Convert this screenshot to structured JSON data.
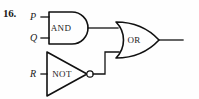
{
  "figure": {
    "problem_number": "16.",
    "type": "logic-circuit-diagram"
  },
  "inputs": [
    {
      "id": "p",
      "label": "P"
    },
    {
      "id": "q",
      "label": "Q"
    },
    {
      "id": "r",
      "label": "R"
    }
  ],
  "gates": [
    {
      "id": "and",
      "label": "AND",
      "shape": "and-gate"
    },
    {
      "id": "or",
      "label": "OR",
      "shape": "or-gate"
    },
    {
      "id": "not",
      "label": "NOT",
      "shape": "not-gate-triangle-with-bubble"
    }
  ],
  "icons": {
    "inverter_bubble": "inverter-bubble-icon"
  },
  "colors": {
    "ink": "#111111",
    "text": "#1a1a1a",
    "background": "#fefefe"
  }
}
